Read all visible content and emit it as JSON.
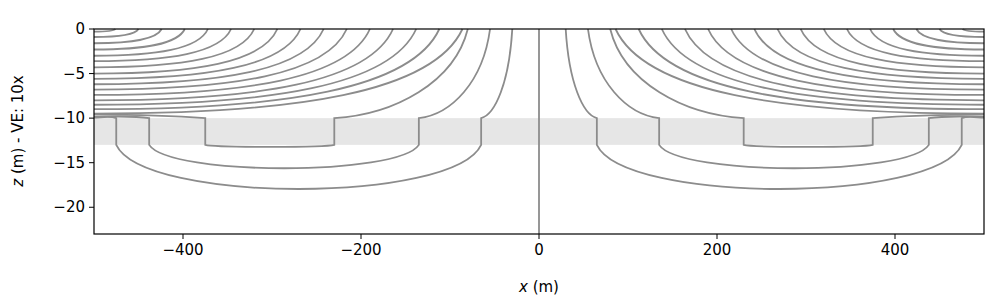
{
  "chart_data": {
    "type": "line",
    "title": "",
    "xlabel": "x (m)",
    "ylabel": "z (m) - VE: 10x",
    "xlim": [
      -500,
      500
    ],
    "ylim": [
      -23,
      0
    ],
    "grid": false,
    "legend": null,
    "x_ticks": [
      -400,
      -200,
      0,
      200,
      400
    ],
    "x_tick_labels": [
      "−400",
      "−200",
      "0",
      "200",
      "400"
    ],
    "y_ticks": [
      0,
      -5,
      -10,
      -15,
      -20
    ],
    "y_tick_labels": [
      "0",
      "−5",
      "−10",
      "−15",
      "−20"
    ],
    "shaded_band": {
      "z_top": -10,
      "z_bottom": -13,
      "color": "#e6e6e6"
    },
    "line_color": "#8c8c8c",
    "center_line": {
      "x": 0,
      "z_from": 0,
      "z_to": -23
    },
    "u_loops_right": [
      {
        "x_left": 230,
        "x_right": 375,
        "z_bottom": -13.3
      },
      {
        "x_left": 135,
        "x_right": 438,
        "z_bottom": -16.5
      },
      {
        "x_left": 65,
        "x_right": 475,
        "z_bottom": -19.6
      }
    ],
    "u_loops_left": [
      {
        "x_left": -375,
        "x_right": -230,
        "z_bottom": -13.3
      },
      {
        "x_left": -438,
        "x_right": -135,
        "z_bottom": -16.5
      },
      {
        "x_left": -475,
        "x_right": -65,
        "z_bottom": -19.6
      }
    ],
    "surface_streamline_start_x": [
      8,
      34,
      60,
      86,
      112,
      138,
      164,
      190,
      216,
      242,
      268,
      294,
      320,
      346,
      372,
      398,
      424,
      450,
      476
    ],
    "upper_streamline_edge_z": [
      -0.3,
      -0.9,
      -1.6,
      -2.3,
      -3.0,
      -3.6,
      -4.3,
      -5.0,
      -5.6,
      -6.2,
      -6.8,
      -7.4,
      -8.0,
      -8.5,
      -9.0,
      -9.5
    ]
  },
  "axes": {
    "xlabel_italic": "x",
    "xlabel_rest": " (m)",
    "ylabel_italic": "z",
    "ylabel_rest": " (m) - VE: 10x"
  }
}
